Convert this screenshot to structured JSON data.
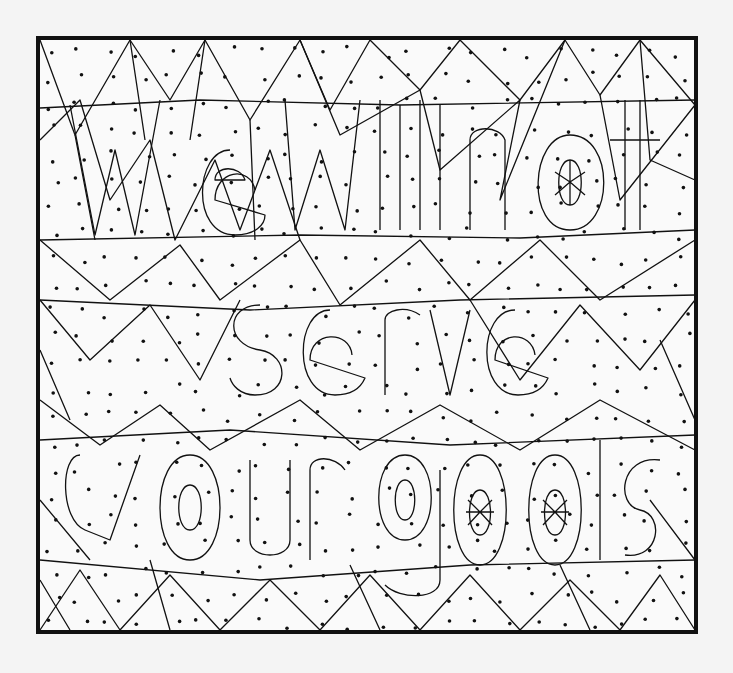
{
  "puzzle": {
    "type": "hidden-message color-by-dot page",
    "hidden_message": "We will not serve your gods",
    "lines": [
      "We will not",
      "serve",
      "your gods"
    ],
    "instruction_implied": "Color every shape that contains a dot to reveal the message",
    "colors": {
      "background": "#f4f4f4",
      "paper": "#fafafa",
      "ink": "#111111"
    },
    "frame": {
      "x": 36,
      "y": 36,
      "width": 661,
      "height": 597
    }
  }
}
